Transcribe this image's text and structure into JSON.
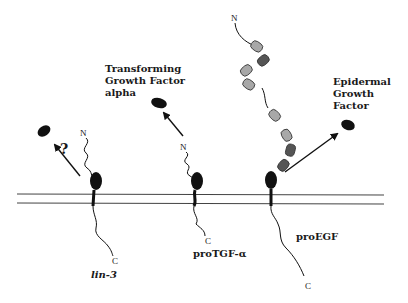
{
  "diagram": {
    "membrane": {
      "color": "#333333"
    },
    "proteins": [
      {
        "id": "lin-3",
        "precursor_label": "lin-3",
        "n_terminus": "N",
        "c_terminus": "C",
        "released_factor_label": "",
        "release_annotation": "?"
      },
      {
        "id": "proTGF-alpha",
        "precursor_label": "proTGF-α",
        "n_terminus": "N",
        "c_terminus": "C",
        "released_factor_label_lines": [
          "Transforming",
          "Growth Factor",
          "alpha"
        ]
      },
      {
        "id": "proEGF",
        "precursor_label": "proEGF",
        "n_terminus": "N",
        "c_terminus": "C",
        "released_factor_label_lines": [
          "Epidermal",
          "Growth",
          "Factor"
        ],
        "domain_colors": {
          "light": "#a8a8a8",
          "dark": "#555555",
          "growth_factor": "#111111"
        }
      }
    ]
  }
}
